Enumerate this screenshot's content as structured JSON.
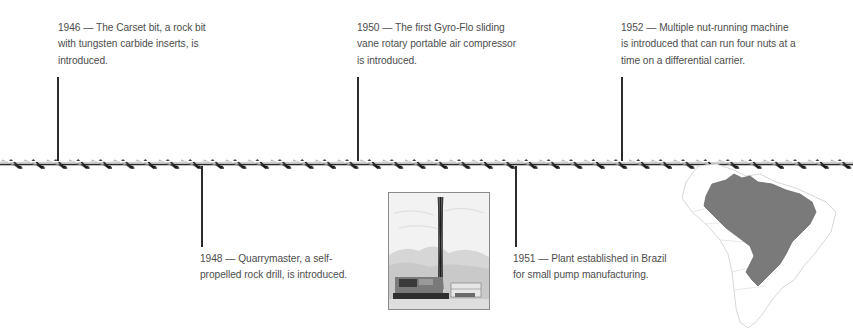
{
  "timeline": {
    "events": [
      {
        "year": "1946",
        "text": "1946 — The Carset bit, a rock bit with tungsten carbide inserts, is introduced.",
        "lines": [
          "1946 — The Carset bit, a rock bit",
          "with tungsten carbide inserts, is",
          "introduced."
        ],
        "position": "above"
      },
      {
        "year": "1948",
        "text": "1948 — Quarrymaster, a self-propelled rock drill, is introduced.",
        "lines": [
          "1948 — Quarrymaster, a self-",
          "propelled rock drill, is introduced."
        ],
        "position": "below"
      },
      {
        "year": "1950",
        "text": "1950 — The first Gyro-Flo sliding vane rotary portable air compressor is introduced.",
        "lines": [
          "1950 — The first Gyro-Flo sliding",
          "vane rotary portable air compressor",
          "is introduced."
        ],
        "position": "above"
      },
      {
        "year": "1951",
        "text": "1951 — Plant established in Brazil for small pump manufacturing.",
        "lines": [
          "1951 — Plant established in Brazil",
          "for small pump manufacturing."
        ],
        "position": "below"
      },
      {
        "year": "1952",
        "text": "1952 — Multiple nut-running machine is introduced that can run four nuts at a time on a differential carrier.",
        "lines": [
          "1952 — Multiple nut-running machine",
          "is introduced that can run four nuts at a",
          "time on a differential carrier."
        ],
        "position": "above"
      }
    ],
    "axis_graphic": "twisted-drill-rod"
  },
  "images": {
    "photo": {
      "description": "drilling-rig-sketch"
    },
    "map": {
      "description": "south-america-map-brazil-highlighted",
      "highlight_color": "#7a7a7a",
      "outline_color": "#d8d8d8"
    }
  },
  "colors": {
    "text": "#4d4d4d",
    "lines": "#2a2a2a",
    "background": "#ffffff"
  }
}
